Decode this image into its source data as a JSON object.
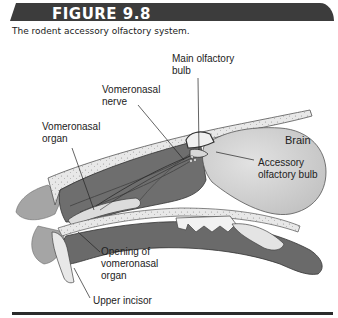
{
  "figure": {
    "number_label": "FIGURE 9.8",
    "caption": "The rodent accessory olfactory system."
  },
  "labels": {
    "main_olfactory_bulb": [
      "Main olfactory",
      "bulb"
    ],
    "vomeronasal_nerve": [
      "Vomeronasal",
      "nerve"
    ],
    "vomeronasal_organ": [
      "Vomeronasal",
      "organ"
    ],
    "brain": "Brain",
    "accessory_olfactory_bulb": [
      "Accessory",
      "olfactory bulb"
    ],
    "opening_vno": [
      "Opening of",
      "vomeronasal",
      "organ"
    ],
    "upper_incisor": "Upper incisor"
  },
  "colors": {
    "header_bg": "#3c3c3c",
    "tissue_dark": "#6b6b6b",
    "tissue_mid": "#8a8a8a",
    "bone": "#e6e6e6",
    "brain": "#cfcfcf",
    "fur": "#9a9a9a"
  }
}
